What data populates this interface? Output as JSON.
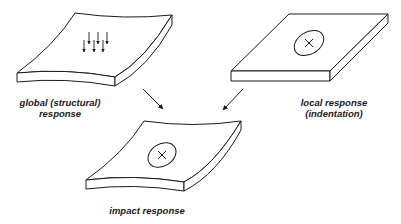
{
  "diagram": {
    "panels": [
      {
        "id": "global",
        "caption_lines": [
          "global (structural)",
          "response"
        ],
        "shape": "curved-plate",
        "markers": "distributed-load-arrows",
        "arrow_count": 6
      },
      {
        "id": "local",
        "caption_lines": [
          "local response",
          "(indentation)"
        ],
        "shape": "flat-plate",
        "markers": "impact-ellipse-cross"
      },
      {
        "id": "impact",
        "caption_lines": [
          "impact response"
        ],
        "shape": "curved-plate",
        "markers": "impact-ellipse-cross"
      }
    ],
    "connectors": [
      {
        "from": "global",
        "to": "impact",
        "icon": "arrow-down-right-icon"
      },
      {
        "from": "local",
        "to": "impact",
        "icon": "arrow-down-left-icon"
      }
    ],
    "colors": {
      "stroke": "#1a1a1a",
      "fill": "#ffffff",
      "text": "#1a1a1a"
    }
  }
}
